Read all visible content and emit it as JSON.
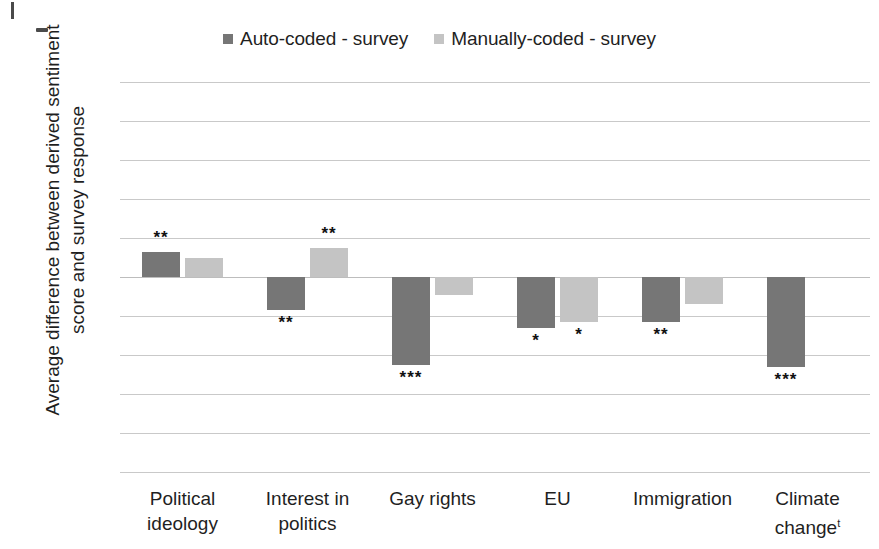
{
  "chart_data": {
    "type": "bar",
    "title": "",
    "xlabel": "",
    "ylabel": "Average difference between derived sentiment\nscore and survey response",
    "ylim": [
      -10,
      10
    ],
    "ytick_values": [
      10,
      8,
      6,
      4,
      2,
      0,
      -2,
      -4,
      -6,
      -8,
      -10
    ],
    "ytick_labels": [
      "10",
      "8",
      "6",
      "4",
      "2",
      "0",
      "-2",
      "-4",
      "-6",
      "-8",
      "-10"
    ],
    "grid": true,
    "legend_position": "top-center",
    "categories": [
      "Political\nideology",
      "Interest in\npolitics",
      "Gay rights",
      "EU",
      "Immigration",
      "Climate\nchange"
    ],
    "category_footnote_marker": "t",
    "category_footnote_index": 5,
    "series": [
      {
        "name": "Auto-coded - survey",
        "color": "#767676",
        "values": [
          1.3,
          -1.7,
          -4.5,
          -2.6,
          -2.3,
          -4.6
        ],
        "significance": [
          "**",
          "**",
          "***",
          "*",
          "**",
          "***"
        ]
      },
      {
        "name": "Manually-coded - survey",
        "color": "#c4c4c4",
        "values": [
          1.0,
          1.5,
          -0.9,
          -2.3,
          -1.4,
          null
        ],
        "significance": [
          "",
          "**",
          "",
          "*",
          "",
          ""
        ]
      }
    ]
  },
  "legend": {
    "items": [
      {
        "label": "Auto-coded - survey",
        "color": "#767676"
      },
      {
        "label": "Manually-coded - survey",
        "color": "#c4c4c4"
      }
    ]
  }
}
